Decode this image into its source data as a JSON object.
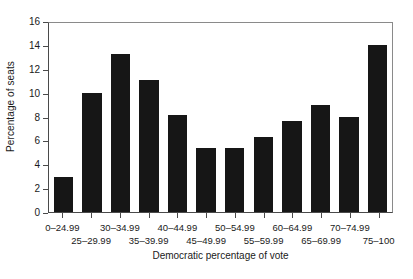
{
  "chart_data": {
    "type": "bar",
    "title": "",
    "subtitle": "",
    "xlabel": "Democratic percentage of vote",
    "ylabel": "Percentage of seats",
    "categories": [
      "0–24.99",
      "25–29.99",
      "30–34.99",
      "35–39.99",
      "40–44.99",
      "45–49.99",
      "50–54.99",
      "55–59.99",
      "60–64.99",
      "65–69.99",
      "70–74.99",
      "75–100"
    ],
    "values": [
      2.9,
      10.0,
      13.25,
      11.1,
      8.15,
      5.4,
      5.4,
      6.3,
      7.65,
      9.0,
      7.95,
      13.95
    ],
    "ylim": [
      0,
      16
    ],
    "ytick_values": [
      0,
      2,
      4,
      6,
      8,
      10,
      12,
      14,
      16
    ],
    "ytick_labels": [
      "0",
      "2",
      "4",
      "6",
      "8",
      "10",
      "12",
      "14",
      "16"
    ],
    "grid": false,
    "legend": null,
    "legend_position": "none",
    "bar_color": "#161616",
    "axis_color": "#4a4a4a",
    "frame_color": "#8a8a8a",
    "background_color": "#ffffff",
    "label_layout": "staggered-two-rows",
    "annotations": []
  }
}
